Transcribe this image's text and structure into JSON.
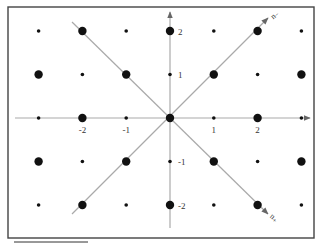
{
  "figure": {
    "frame": {
      "x": 8,
      "y": 7,
      "w": 306,
      "h": 231,
      "color": "#444444"
    },
    "underline": {
      "x1": 14,
      "x2": 88,
      "y": 242
    },
    "origin": {
      "x": 170,
      "y": 118
    },
    "spacing": {
      "x": 43.8,
      "y": 43.5
    },
    "grid": {
      "cols": [
        -3,
        -2,
        -1,
        0,
        1,
        2,
        3
      ],
      "rows": [
        2,
        1,
        0,
        -1,
        -2
      ]
    },
    "dot_rule": "large where (i+j) even, small where odd",
    "large_radius": 4.2,
    "small_radius": 1.8,
    "axis_color": "#aaaaaa",
    "dot_color": "#111111",
    "x_axis": {
      "from": 15,
      "to": 310
    },
    "y_axis": {
      "from": 228,
      "to": 12
    },
    "x_tick_labels": [
      {
        "value": -2,
        "label": "-2"
      },
      {
        "value": -1,
        "label": "-1"
      },
      {
        "value": 1,
        "label": "1"
      },
      {
        "value": 2,
        "label": "2"
      }
    ],
    "y_tick_labels": [
      {
        "value": 2,
        "label": "2"
      },
      {
        "value": 1,
        "label": "1"
      },
      {
        "value": -1,
        "label": "-1"
      },
      {
        "value": -2,
        "label": "-2"
      }
    ],
    "diagonals": [
      {
        "name": "n-minus",
        "from": [
          72,
          214
        ],
        "to": [
          268,
          18
        ],
        "label": "n₋"
      },
      {
        "name": "n-plus",
        "from": [
          72,
          22
        ],
        "to": [
          268,
          214
        ],
        "label": "n₊"
      }
    ]
  }
}
